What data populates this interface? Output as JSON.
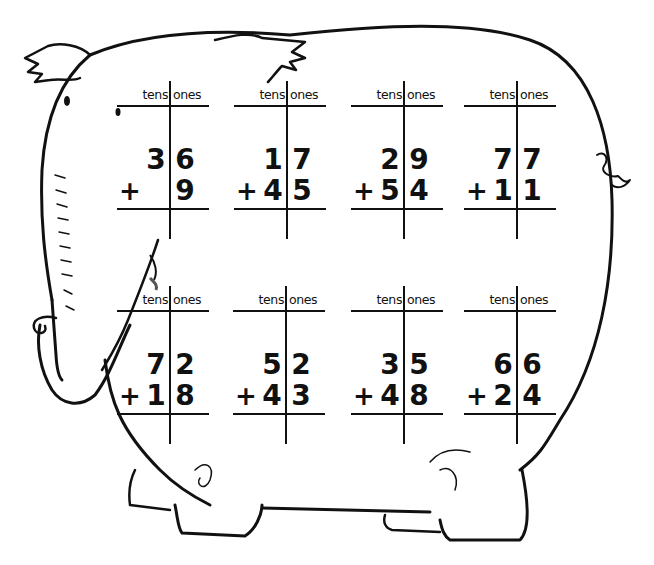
{
  "worksheet": {
    "theme": "elephant",
    "column_headers": {
      "tens": "tens",
      "ones": "ones"
    },
    "operator": "+",
    "problems": [
      {
        "top_tens": "3",
        "top_ones": "6",
        "bottom_tens": "",
        "bottom_ones": "9"
      },
      {
        "top_tens": "1",
        "top_ones": "7",
        "bottom_tens": "4",
        "bottom_ones": "5"
      },
      {
        "top_tens": "2",
        "top_ones": "9",
        "bottom_tens": "5",
        "bottom_ones": "4"
      },
      {
        "top_tens": "7",
        "top_ones": "7",
        "bottom_tens": "1",
        "bottom_ones": "1"
      },
      {
        "top_tens": "7",
        "top_ones": "2",
        "bottom_tens": "1",
        "bottom_ones": "8"
      },
      {
        "top_tens": "5",
        "top_ones": "2",
        "bottom_tens": "4",
        "bottom_ones": "3"
      },
      {
        "top_tens": "3",
        "top_ones": "5",
        "bottom_tens": "4",
        "bottom_ones": "8"
      },
      {
        "top_tens": "6",
        "top_ones": "6",
        "bottom_tens": "2",
        "bottom_ones": "4"
      }
    ]
  }
}
